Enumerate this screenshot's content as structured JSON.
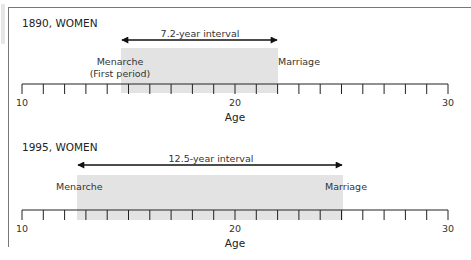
{
  "panels": [
    {
      "title": "1890, WOMEN",
      "interval_label": "7.2-year interval",
      "start_label_line1": "Menarche",
      "start_label_line2": "(First period)",
      "end_label": "Marriage",
      "axis_title": "Age",
      "tick_labels": [
        "10",
        "20",
        "30"
      ]
    },
    {
      "title": "1995, WOMEN",
      "interval_label": "12.5-year interval",
      "start_label_line1": "Menarche",
      "end_label": "Marriage",
      "axis_title": "Age",
      "tick_labels": [
        "10",
        "20",
        "30"
      ]
    }
  ],
  "colors": {
    "shade": "#e3e3e3",
    "axis": "#222222",
    "frame": "#777777"
  },
  "chart_data": [
    {
      "type": "timeline",
      "title": "1890, WOMEN",
      "xlabel": "Age",
      "xlim": [
        10,
        30
      ],
      "major_ticks": [
        10,
        20,
        30
      ],
      "minor_tick_step": 1,
      "interval": {
        "start": 14.8,
        "end": 22.0,
        "length": 7.2,
        "label": "7.2-year interval"
      },
      "annotations": [
        "Menarche (First period)",
        "Marriage"
      ]
    },
    {
      "type": "timeline",
      "title": "1995, WOMEN",
      "xlabel": "Age",
      "xlim": [
        10,
        30
      ],
      "major_ticks": [
        10,
        20,
        30
      ],
      "minor_tick_step": 1,
      "interval": {
        "start": 12.5,
        "end": 25.0,
        "length": 12.5,
        "label": "12.5-year interval"
      },
      "annotations": [
        "Menarche",
        "Marriage"
      ]
    }
  ]
}
